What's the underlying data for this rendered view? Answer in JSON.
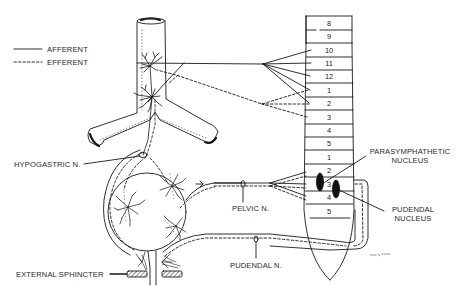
{
  "figure": {
    "type": "anatomical-diagram",
    "page_number": "573",
    "signature": "mr.e.m."
  },
  "legend": {
    "items": [
      {
        "label": "AFFERENT",
        "line_style": "solid"
      },
      {
        "label": "EFFERENT",
        "line_style": "dashed"
      }
    ]
  },
  "spinal_cord": {
    "thoracic_segments": [
      "8",
      "9",
      "10",
      "11",
      "12"
    ],
    "lumbar_segments": [
      "1",
      "2",
      "3",
      "4",
      "5"
    ],
    "sacral_segments": [
      "1",
      "2",
      "3",
      "4",
      "5"
    ]
  },
  "labels": {
    "hypogastric": "HYPOGASTRIC N.",
    "pelvic": "PELVIC N.",
    "pudendal": "PUDENDAL N.",
    "external_sphincter": "EXTERNAL SPHINCTER",
    "parasympathetic_line1": "PARASYMPHATHETIC",
    "parasympathetic_line2": "NUCLEUS",
    "pudendal_nucleus_line1": "PUDENDAL",
    "pudendal_nucleus_line2": "NUCLEUS"
  },
  "colors": {
    "ink": "#1a1a1a",
    "paper": "#ffffff",
    "label": "#2a2a2a"
  }
}
